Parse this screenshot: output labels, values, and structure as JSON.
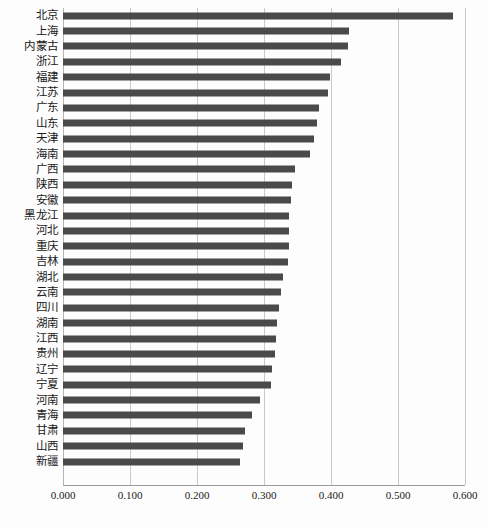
{
  "chart_data": {
    "type": "bar",
    "orientation": "horizontal",
    "title": "",
    "subtitle": "",
    "xlabel": "",
    "ylabel": "",
    "xlim": [
      0.0,
      0.6
    ],
    "grid": true,
    "legend": null,
    "bar_color": "#4a4a4a",
    "background_color": "#fdfdfd",
    "gridline_color": "#c9c9c9",
    "axis_tick_labels": [
      "0.000",
      "0.100",
      "0.200",
      "0.300",
      "0.400",
      "0.500",
      "0.600"
    ],
    "axis_tick_values": [
      0.0,
      0.1,
      0.2,
      0.3,
      0.4,
      0.5,
      0.6
    ],
    "categories": [
      "北京",
      "上海",
      "内蒙古",
      "浙江",
      "福建",
      "江苏",
      "广东",
      "山东",
      "天津",
      "海南",
      "广西",
      "陕西",
      "安徽",
      "黑龙江",
      "河北",
      "重庆",
      "吉林",
      "湖北",
      "云南",
      "四川",
      "湖南",
      "江西",
      "贵州",
      "辽宁",
      "宁夏",
      "河南",
      "青海",
      "甘肃",
      "山西",
      "新疆"
    ],
    "values": [
      0.582,
      0.427,
      0.426,
      0.415,
      0.399,
      0.396,
      0.382,
      0.379,
      0.374,
      0.368,
      0.347,
      0.342,
      0.34,
      0.338,
      0.337,
      0.337,
      0.336,
      0.329,
      0.325,
      0.322,
      0.32,
      0.318,
      0.316,
      0.312,
      0.31,
      0.294,
      0.282,
      0.272,
      0.268,
      0.264
    ],
    "caption": ""
  }
}
